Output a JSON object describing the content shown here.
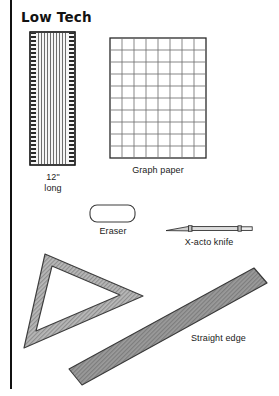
{
  "page": {
    "title": "Low Tech",
    "background_color": "#ffffff",
    "ink_color": "#1a1a1a",
    "margin_rule_color": "#111111"
  },
  "items": [
    {
      "id": "ruler",
      "icon": "ruler-icon",
      "label_line1": "12\"",
      "label_line2": "long",
      "fill": "#f2f2f2",
      "stroke": "#1a1a1a"
    },
    {
      "id": "graph-paper",
      "icon": "grid-icon",
      "label": "Graph paper",
      "columns": 8,
      "rows": 10,
      "fill": "#ffffff",
      "stroke": "#2a2a2a",
      "grid_color": "#6e6e6e"
    },
    {
      "id": "eraser",
      "icon": "eraser-icon",
      "label": "Eraser",
      "fill": "#ffffff",
      "stroke": "#3a3a3a"
    },
    {
      "id": "xacto-knife",
      "icon": "knife-icon",
      "label": "X-acto knife",
      "fill": "#d6d6d6",
      "stroke": "#2a2a2a"
    },
    {
      "id": "triangle",
      "icon": "triangle-icon",
      "label": "",
      "fill": "#e3e3e3",
      "stroke": "#4a4a4a"
    },
    {
      "id": "straight-edge",
      "icon": "straightedge-icon",
      "label": "Straight edge",
      "fill": "#9e9e9e",
      "stroke": "#3a3a3a"
    }
  ]
}
